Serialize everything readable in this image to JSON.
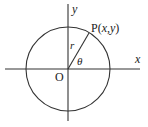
{
  "diagram": {
    "type": "unit-circle-polar",
    "labels": {
      "x_axis": "x",
      "y_axis": "y",
      "origin": "O",
      "point": "P(x,y)",
      "point_prefix": "P(",
      "point_x": "x",
      "point_comma": ",",
      "point_y": "y",
      "point_suffix": ")",
      "radius": "r",
      "angle": "θ"
    },
    "colors": {
      "stroke": "#333333",
      "background": "#ffffff"
    }
  }
}
